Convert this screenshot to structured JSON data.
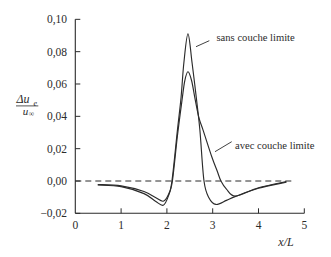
{
  "chart_data": {
    "type": "line",
    "title": "",
    "xlabel": "x/L",
    "ylabel": {
      "text": "Δu_e / u_∞",
      "numerator": "Δu",
      "numerator_sub": "e",
      "denominator": "u",
      "denominator_sub": "∞"
    },
    "xlim": [
      0,
      5
    ],
    "ylim": [
      -0.02,
      0.1
    ],
    "grid": false,
    "legend": null,
    "x_ticks": [
      {
        "value": 0,
        "label": "0"
      },
      {
        "value": 1,
        "label": "1"
      },
      {
        "value": 2,
        "label": "2"
      },
      {
        "value": 3,
        "label": "3"
      },
      {
        "value": 4,
        "label": "4"
      },
      {
        "value": 5,
        "label": "5"
      }
    ],
    "y_ticks": [
      {
        "value": 0.1,
        "label": "0,10"
      },
      {
        "value": 0.08,
        "label": "0,08"
      },
      {
        "value": 0.06,
        "label": "0,06"
      },
      {
        "value": 0.04,
        "label": "0,04"
      },
      {
        "value": 0.02,
        "label": "0,02"
      },
      {
        "value": 0.0,
        "label": "0,00"
      },
      {
        "value": -0.02,
        "label": "−0,02"
      }
    ],
    "reference_line": {
      "y": 0.0,
      "style": "dashed",
      "x_range": [
        0,
        4.75
      ]
    },
    "series": [
      {
        "name": "sans couche limite",
        "x": [
          0.5,
          1.0,
          1.5,
          1.75,
          1.92,
          2.03,
          2.11,
          2.23,
          2.31,
          2.37,
          2.46,
          2.55,
          2.64,
          2.72,
          2.81,
          2.92,
          3.07,
          3.3,
          3.5,
          4.0,
          4.6
        ],
        "y": [
          -0.0025,
          -0.0035,
          -0.0078,
          -0.0125,
          -0.015,
          -0.0095,
          0.0,
          0.0315,
          0.052,
          0.073,
          0.091,
          0.073,
          0.052,
          0.0315,
          0.0,
          -0.0105,
          -0.0145,
          -0.012,
          -0.0095,
          -0.0045,
          -0.0008
        ]
      },
      {
        "name": "avec couche limite",
        "x": [
          0.5,
          1.0,
          1.5,
          1.75,
          1.92,
          2.04,
          2.12,
          2.23,
          2.33,
          2.39,
          2.46,
          2.54,
          2.62,
          2.7,
          2.79,
          2.98,
          3.1,
          3.18,
          3.3,
          3.5,
          4.0,
          4.6
        ],
        "y": [
          -0.0022,
          -0.003,
          -0.0065,
          -0.0102,
          -0.0125,
          -0.008,
          0.0,
          0.028,
          0.05,
          0.062,
          0.0676,
          0.062,
          0.05,
          0.039,
          0.0315,
          0.015,
          0.006,
          0.0,
          -0.005,
          -0.0093,
          -0.0042,
          -0.0004
        ]
      }
    ],
    "annotations": [
      {
        "text": "sans couche limite",
        "target_series": 0
      },
      {
        "text": "avec couche limite",
        "target_series": 1
      }
    ],
    "colors": {
      "line": "#2b2b2b",
      "background": "#ffffff"
    }
  }
}
